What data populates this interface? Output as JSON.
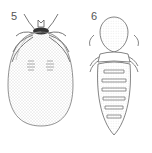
{
  "figures": [
    {
      "label": "5",
      "subject": "tick (engorged, dorsal view)"
    },
    {
      "label": "6",
      "subject": "louse (dorsal view)"
    }
  ]
}
